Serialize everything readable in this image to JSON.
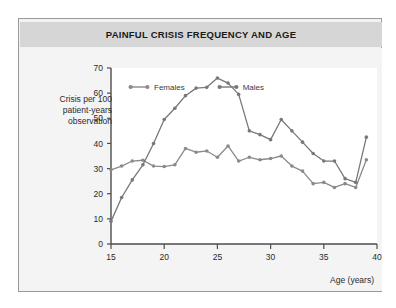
{
  "panel": {
    "title": "PAINFUL CRISIS FREQUENCY AND AGE"
  },
  "chart_data": {
    "type": "line",
    "title": "PAINFUL CRISIS FREQUENCY AND AGE",
    "xlabel": "Age (years)",
    "ylabel": "Crisis per 100 patient-years observation",
    "ylabel_lines": [
      "Crisis per 100",
      "patient-years",
      "observation"
    ],
    "xlim": [
      15,
      40
    ],
    "ylim": [
      0,
      70
    ],
    "xticks": [
      15,
      20,
      25,
      30,
      35,
      40
    ],
    "yticks": [
      0,
      10,
      20,
      30,
      40,
      50,
      60,
      70
    ],
    "grid": false,
    "legend_position": "top",
    "x": [
      15,
      16,
      17,
      18,
      19,
      20,
      21,
      22,
      23,
      24,
      25,
      26,
      27,
      28,
      29,
      30,
      31,
      32,
      33,
      34,
      35,
      36,
      37,
      38,
      39
    ],
    "series": [
      {
        "name": "Females",
        "color": "#8a8a8a",
        "marker": "circle",
        "values": [
          29.5,
          31.0,
          33.0,
          33.3,
          31.0,
          30.8,
          31.5,
          38.0,
          36.5,
          37.0,
          34.5,
          39.0,
          33.0,
          34.5,
          33.5,
          34.0,
          35.0,
          31.0,
          29.0,
          24.0,
          24.5,
          22.5,
          24.0,
          22.5,
          33.5
        ]
      },
      {
        "name": "Males",
        "color": "#787878",
        "marker": "circle",
        "values": [
          9.0,
          18.5,
          25.5,
          31.5,
          40.0,
          49.5,
          54.0,
          59.0,
          62.0,
          62.3,
          66.0,
          64.0,
          59.5,
          45.0,
          43.5,
          41.5,
          49.5,
          45.0,
          40.5,
          36.0,
          33.0,
          33.0,
          26.0,
          24.5,
          42.5
        ]
      }
    ],
    "colors": {
      "title_bar": "#d6d6d6",
      "panel_bg": "#f2f2f2",
      "plot_bg": "#ffffff",
      "axis": "#555555",
      "females": "#8a8a8a",
      "males": "#787878"
    }
  }
}
